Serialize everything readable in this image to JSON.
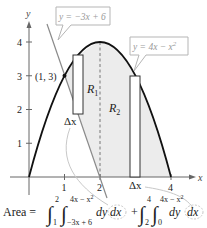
{
  "figure": {
    "axes": {
      "x_label": "x",
      "y_label": "y",
      "x_ticks": [
        "1",
        "2",
        "4"
      ],
      "y_ticks": [
        "1",
        "2",
        "3",
        "4"
      ]
    },
    "callouts": {
      "line": "y = −3x + 6",
      "parabola_base": "y = 4x − x",
      "parabola_exp": "2"
    },
    "point_label": "(1, 3)",
    "regions": {
      "r1": {
        "main": "R",
        "sub": "1"
      },
      "r2": {
        "main": "R",
        "sub": "2"
      }
    },
    "delta_x": [
      "Δx",
      "Δx"
    ],
    "formula": {
      "lead": "Area =",
      "int1": {
        "upper": "2",
        "lower": "1",
        "inner_upper": "4x − x",
        "inner_upper_exp": "2",
        "inner_lower": "−3x + 6",
        "dy": "dy",
        "dx": "dx"
      },
      "plus": "+",
      "int2": {
        "upper": "4",
        "lower": "2",
        "inner_upper": "4x − x",
        "inner_upper_exp": "2",
        "inner_lower": "0",
        "dy": "dy",
        "dx": "dx"
      }
    },
    "colors": {
      "shade": "#ececec",
      "curve": "#111111",
      "line": "#8a8a8a",
      "callout": "#b5b5b5",
      "leader": "#c8c8c8"
    }
  }
}
